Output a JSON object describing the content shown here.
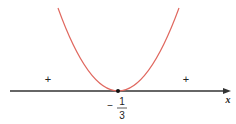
{
  "diagram": {
    "type": "sign-chart",
    "curve_color": "#e0685f",
    "axis_color": "#333333",
    "axis_label": "x",
    "vertex_label": {
      "sign": "−",
      "numerator": "1",
      "denominator": "3"
    },
    "left_sign": "+",
    "right_sign": "+"
  }
}
